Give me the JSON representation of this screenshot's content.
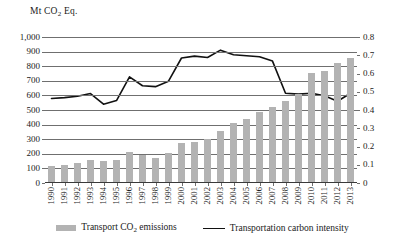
{
  "chart_data": {
    "type": "bar",
    "title": "",
    "subtitle": "",
    "ylabel": "Mt CO2 Eq.",
    "ylabel_rich": {
      "prefix": "Mt CO",
      "sub": "2",
      "suffix": " Eq."
    },
    "xlabel": "",
    "grid": true,
    "legend_position": "bottom",
    "categories": [
      "1990",
      "1991",
      "1992",
      "1993",
      "1994",
      "1995",
      "1996",
      "1997",
      "1998",
      "1999",
      "2000",
      "2001",
      "2002",
      "2003",
      "2004",
      "2005",
      "2006",
      "2007",
      "2008",
      "2009",
      "2010",
      "2011",
      "2012",
      "2013"
    ],
    "axes": {
      "left": {
        "label": "Mt CO2 Eq.",
        "ylim": [
          0,
          1000
        ],
        "tick_step": 100,
        "ticks": [
          0,
          100,
          200,
          300,
          400,
          500,
          600,
          700,
          800,
          900,
          1000
        ],
        "tick_labels": [
          "0",
          "100",
          "200",
          "300",
          "400",
          "500",
          "600",
          "700",
          "800",
          "900",
          "1,000"
        ]
      },
      "right": {
        "label": "",
        "ylim": [
          0,
          0.8
        ],
        "tick_step": 0.1,
        "ticks": [
          0,
          0.1,
          0.2,
          0.3,
          0.4,
          0.5,
          0.6,
          0.7,
          0.8
        ],
        "tick_labels": [
          "0",
          "0.1",
          "0.2",
          "0.3",
          "0.4",
          "0.5",
          "0.6",
          "0.7",
          "0.8"
        ]
      }
    },
    "series": [
      {
        "name": "Transport CO2 emissions",
        "name_rich": {
          "prefix": "Transport CO",
          "sub": "2",
          "suffix": " emissions"
        },
        "type": "bar",
        "axis": "left",
        "color": "#b3b3b3",
        "values": [
          110,
          118,
          133,
          150,
          142,
          152,
          208,
          182,
          165,
          200,
          270,
          277,
          293,
          348,
          402,
          430,
          478,
          515,
          558,
          600,
          748,
          762,
          812,
          852
        ]
      },
      {
        "name": "Transportation carbon intensity",
        "type": "line",
        "axis": "right",
        "color": "#111111",
        "values": [
          0.463,
          0.468,
          0.475,
          0.49,
          0.432,
          0.452,
          0.582,
          0.533,
          0.528,
          0.558,
          0.685,
          0.695,
          0.688,
          0.728,
          0.703,
          0.697,
          0.692,
          0.668,
          0.492,
          0.487,
          0.492,
          0.478,
          0.448,
          0.492
        ]
      }
    ]
  },
  "legend": {
    "items": [
      {
        "label": "Transport CO2 emissions",
        "marker": "bar-swatch",
        "color": "#b3b3b3"
      },
      {
        "label": "Transportation carbon intensity",
        "marker": "line-swatch",
        "color": "#111111"
      }
    ]
  }
}
